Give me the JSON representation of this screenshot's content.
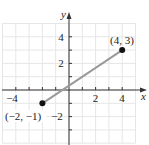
{
  "chart_data": {
    "type": "line",
    "title": "",
    "xlabel": "x",
    "ylabel": "y",
    "xlim": [
      -5,
      5
    ],
    "ylim": [
      -4,
      5
    ],
    "grid": true,
    "x_ticks": [
      -4,
      -3,
      -2,
      -1,
      1,
      2,
      3,
      4
    ],
    "y_ticks": [
      -3,
      -2,
      -1,
      1,
      2,
      3,
      4
    ],
    "x_tick_labels": [
      {
        "value": -4,
        "label": "−4"
      },
      {
        "value": 2,
        "label": "2"
      },
      {
        "value": 4,
        "label": "4"
      }
    ],
    "y_tick_labels": [
      {
        "value": 4,
        "label": "4"
      },
      {
        "value": 2,
        "label": "2"
      },
      {
        "value": -2,
        "label": "−2"
      }
    ],
    "series": [
      {
        "name": "segment",
        "points": [
          {
            "x": -2,
            "y": -1,
            "label": "(−2, −1)"
          },
          {
            "x": 4,
            "y": 3,
            "label": "(4, 3)"
          }
        ]
      }
    ]
  },
  "colors": {
    "grid": "#e6e6e6",
    "axis": "#333333",
    "segment": "#9a9a9a",
    "point": "#111111",
    "text": "#222222"
  },
  "labels": {
    "x_axis": "x",
    "y_axis": "y",
    "point_a": "(−2, −1)",
    "point_b": "(4, 3)",
    "tick_x_neg4": "−4",
    "tick_x_2": "2",
    "tick_x_4": "4",
    "tick_y_4": "4",
    "tick_y_2": "2",
    "tick_y_neg2": "−2"
  }
}
